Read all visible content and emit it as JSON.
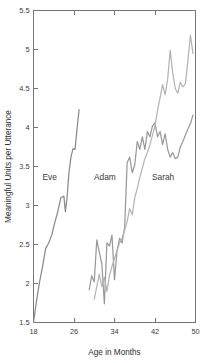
{
  "chart_data": {
    "type": "line",
    "title": "",
    "xlabel": "Age in Months",
    "ylabel": "Meaningful Units per Utterance",
    "xlim": [
      18,
      50
    ],
    "ylim": [
      1.5,
      5.5
    ],
    "xticks": [
      18,
      26,
      34,
      42,
      50
    ],
    "xtick_labels": [
      "18",
      "26",
      "34",
      "42",
      "50"
    ],
    "yticks": [
      1.5,
      2,
      2.5,
      3,
      3.5,
      4,
      4.5,
      5,
      5.5
    ],
    "ytick_labels": [
      "1.5",
      "2",
      "2.5",
      "3",
      "3.5",
      "4",
      "4.5",
      "5",
      "5.5"
    ],
    "grid": false,
    "legend_position": "inline-annotations",
    "frame": true,
    "series": [
      {
        "name": "Eve",
        "color": "#8a8a8a",
        "label_x": 21.2,
        "label_y": 3.33,
        "x": [
          18.0,
          18.6,
          19.2,
          19.8,
          20.4,
          21.0,
          21.6,
          22.2,
          22.8,
          23.4,
          24.0,
          24.3,
          24.6,
          25.0,
          25.4,
          25.8,
          26.2,
          26.6,
          27.0
        ],
        "y": [
          1.5,
          1.78,
          2.02,
          2.22,
          2.45,
          2.52,
          2.62,
          2.78,
          2.92,
          3.1,
          3.12,
          2.92,
          3.08,
          3.42,
          3.62,
          3.73,
          3.72,
          3.98,
          4.23
        ]
      },
      {
        "name": "Adam",
        "color": "#9a9a9a",
        "label_x": 32.1,
        "label_y": 3.33,
        "x": [
          29.0,
          29.5,
          30.0,
          30.5,
          31.0,
          31.5,
          32.0,
          32.5,
          33.0,
          33.5,
          34.0,
          34.5,
          35.0,
          35.5,
          36.0,
          36.5,
          37.0,
          37.5,
          38.0,
          38.5,
          39.0,
          39.5,
          40.0,
          40.5,
          41.0,
          41.5,
          42.0,
          42.5,
          43.0,
          43.5,
          44.0,
          44.5,
          45.0,
          45.5,
          46.0,
          46.5,
          47.0,
          47.5,
          48.0,
          48.5,
          49.0,
          49.5
        ],
        "y": [
          1.92,
          2.1,
          2.02,
          2.56,
          2.4,
          2.25,
          1.74,
          2.52,
          2.48,
          2.62,
          2.05,
          2.42,
          2.58,
          2.52,
          2.72,
          3.55,
          3.62,
          3.42,
          3.52,
          3.82,
          3.72,
          3.88,
          3.72,
          3.95,
          3.88,
          4.02,
          4.06,
          3.88,
          3.95,
          3.78,
          3.92,
          3.72,
          3.62,
          3.68,
          3.6,
          3.62,
          3.75,
          3.82,
          3.9,
          3.98,
          4.05,
          4.16
        ]
      },
      {
        "name": "Sarah",
        "color": "#b4b4b4",
        "label_x": 43.6,
        "label_y": 3.33,
        "x": [
          30.0,
          30.5,
          31.0,
          31.5,
          32.0,
          32.5,
          33.0,
          33.5,
          34.0,
          34.5,
          35.0,
          35.5,
          36.0,
          36.5,
          37.0,
          37.5,
          38.0,
          38.5,
          39.0,
          39.5,
          40.0,
          40.5,
          41.0,
          41.5,
          42.0,
          42.5,
          43.0,
          43.5,
          44.0,
          44.5,
          45.0,
          45.5,
          46.0,
          46.5,
          47.0,
          47.5,
          48.0,
          48.5,
          49.0,
          49.5
        ],
        "y": [
          1.8,
          1.96,
          2.12,
          1.96,
          2.08,
          1.9,
          2.1,
          2.22,
          2.32,
          2.42,
          2.52,
          2.58,
          2.68,
          2.8,
          2.96,
          2.88,
          3.1,
          3.22,
          3.36,
          3.48,
          3.6,
          3.68,
          3.78,
          3.9,
          4.02,
          4.22,
          4.38,
          4.55,
          4.42,
          4.62,
          4.99,
          4.7,
          4.5,
          4.44,
          4.58,
          4.52,
          4.56,
          4.86,
          5.18,
          4.95
        ]
      }
    ]
  }
}
